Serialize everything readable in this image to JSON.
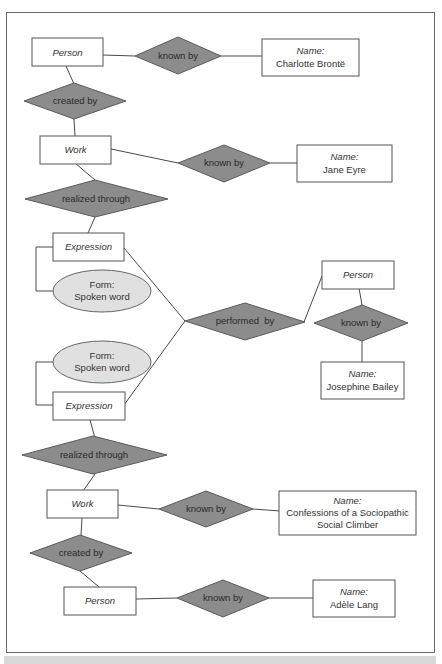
{
  "diagram": {
    "colors": {
      "relationship_fill": "#8c8c8c",
      "attribute_fill": "#e0e0e0",
      "entity_fill": "#ffffff",
      "stroke": "#555555",
      "frame_border": "#6a6a6a"
    },
    "entities": [
      {
        "id": "person1",
        "label": "Person",
        "italic": true
      },
      {
        "id": "name1",
        "label_line1": "Name:",
        "label_line2": "Charlotte Brontë"
      },
      {
        "id": "work1",
        "label": "Work",
        "italic": true
      },
      {
        "id": "name2",
        "label_line1": "Name:",
        "label_line2": "Jane Eyre"
      },
      {
        "id": "expr1",
        "label": "Expression",
        "italic": true
      },
      {
        "id": "person2",
        "label": "Person",
        "italic": true
      },
      {
        "id": "name3",
        "label_line1": "Name:",
        "label_line2": "Josephine Bailey"
      },
      {
        "id": "expr2",
        "label": "Expression",
        "italic": true
      },
      {
        "id": "work2",
        "label": "Work",
        "italic": true
      },
      {
        "id": "name4",
        "label_line1": "Name:",
        "label_line2": "Confessions of a Sociopathic",
        "label_line3": "Social Climber"
      },
      {
        "id": "person3",
        "label": "Person",
        "italic": true
      },
      {
        "id": "name5",
        "label_line1": "Name:",
        "label_line2": "Adèle Lang"
      }
    ],
    "relationships": [
      {
        "id": "rel_known1",
        "label": "known by"
      },
      {
        "id": "rel_created1",
        "label": "created by"
      },
      {
        "id": "rel_known2",
        "label": "known by"
      },
      {
        "id": "rel_realized1",
        "label": "realized through"
      },
      {
        "id": "rel_performed",
        "label": "performed  by"
      },
      {
        "id": "rel_known3",
        "label": "known by"
      },
      {
        "id": "rel_realized2",
        "label": "realized through"
      },
      {
        "id": "rel_known4",
        "label": "known by"
      },
      {
        "id": "rel_created2",
        "label": "created by"
      },
      {
        "id": "rel_known5",
        "label": "known by"
      }
    ],
    "attributes": [
      {
        "id": "form1",
        "label_line1": "Form:",
        "label_line2": "Spoken word"
      },
      {
        "id": "form2",
        "label_line1": "Form:",
        "label_line2": "Spoken word"
      }
    ]
  }
}
